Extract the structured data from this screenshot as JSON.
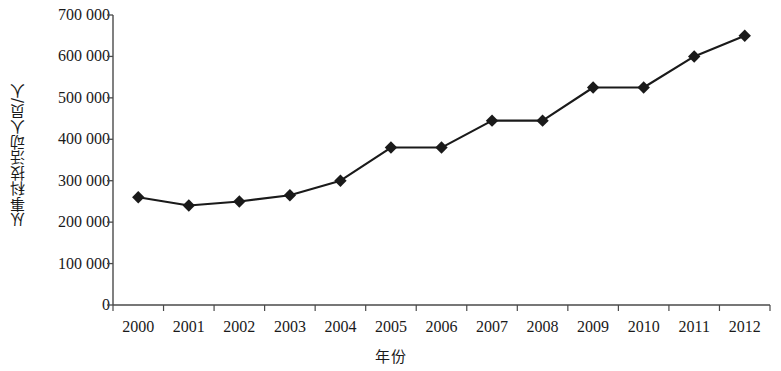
{
  "chart_data": {
    "type": "line",
    "title": "",
    "xlabel": "年份",
    "ylabel": "从事科技活动人员/人",
    "categories": [
      "2000",
      "2001",
      "2002",
      "2003",
      "2004",
      "2005",
      "2006",
      "2007",
      "2008",
      "2009",
      "2010",
      "2011",
      "2012"
    ],
    "values": [
      260000,
      240000,
      250000,
      265000,
      300000,
      380000,
      380000,
      445000,
      445000,
      525000,
      525000,
      600000,
      650000
    ],
    "series": [
      {
        "name": "从事科技活动人员",
        "values": [
          260000,
          240000,
          250000,
          265000,
          300000,
          380000,
          380000,
          445000,
          445000,
          525000,
          525000,
          600000,
          650000
        ]
      }
    ],
    "ylim": [
      0,
      700000
    ],
    "y_ticks": [
      0,
      100000,
      200000,
      300000,
      400000,
      500000,
      600000,
      700000
    ],
    "y_tick_labels": [
      "0",
      "100 000",
      "200 000",
      "300 000",
      "400 000",
      "500 000",
      "600 000",
      "700 000"
    ],
    "grid": false,
    "legend": "none",
    "marker": "diamond",
    "line_color": "#1a1a1a",
    "marker_color": "#1a1a1a",
    "background_color": "#ffffff",
    "axis_color": "#4a4a4a"
  }
}
